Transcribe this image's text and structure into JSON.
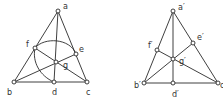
{
  "figures": [
    {
      "name": "left-triangle",
      "points": {
        "a": {
          "x": 58,
          "y": 11,
          "label": "a",
          "lx": 63,
          "ly": 9
        },
        "b": {
          "x": 14,
          "y": 82,
          "label": "b",
          "lx": 7,
          "ly": 95
        },
        "c": {
          "x": 87,
          "y": 82,
          "label": "c",
          "lx": 86,
          "ly": 95
        },
        "d": {
          "x": 54,
          "y": 82,
          "label": "d",
          "lx": 52,
          "ly": 95
        },
        "e": {
          "x": 76,
          "y": 54,
          "label": "e",
          "lx": 79,
          "ly": 52
        },
        "f": {
          "x": 35,
          "y": 48,
          "label": "f",
          "lx": 26,
          "ly": 47
        },
        "g": {
          "x": 56,
          "y": 62,
          "label": "g",
          "lx": 63,
          "ly": 68
        }
      }
    },
    {
      "name": "right-triangle",
      "points": {
        "a": {
          "x": 173,
          "y": 11,
          "label": "a′",
          "lx": 178,
          "ly": 10
        },
        "b": {
          "x": 144,
          "y": 83,
          "label": "b′",
          "lx": 134,
          "ly": 88
        },
        "c": {
          "x": 218,
          "y": 83,
          "label": "c′",
          "lx": 220,
          "ly": 88
        },
        "d": {
          "x": 173,
          "y": 83,
          "label": "d′",
          "lx": 172,
          "ly": 97
        },
        "e": {
          "x": 193,
          "y": 43,
          "label": "e′",
          "lx": 197,
          "ly": 40
        },
        "f": {
          "x": 157,
          "y": 50,
          "label": "f′",
          "lx": 148,
          "ly": 48
        },
        "g": {
          "x": 173,
          "y": 59,
          "label": "g′",
          "lx": 179,
          "ly": 64
        }
      }
    }
  ]
}
